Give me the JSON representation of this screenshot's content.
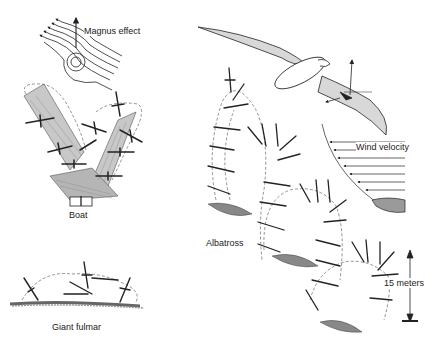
{
  "figure": {
    "panels": {
      "magnus": {
        "label": "Magnus effect"
      },
      "boat": {
        "label": "Boat"
      },
      "fulmar": {
        "label": "Giant fulmar"
      },
      "albatross": {
        "label": "Albatross"
      },
      "wind": {
        "label": "Wind velocity"
      },
      "scale": {
        "label": "15 meters"
      }
    },
    "colors": {
      "ink": "#222222",
      "dashed_path": "#666666",
      "wing_fill": "#d8d8d8",
      "wave_fill": "#9a9a9a"
    }
  }
}
